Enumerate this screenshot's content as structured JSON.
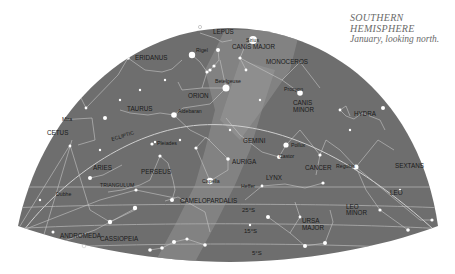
{
  "caption": {
    "line1": "SOUTHERN",
    "line2": "HEMISPHERE",
    "line3": "January, looking north."
  },
  "colors": {
    "sky": "#6e6e6e",
    "milky_way": "#8c8c8c",
    "lines": "#c8c8c8",
    "stars": "#ffffff",
    "labels": "#1a1a1a",
    "caption": "#6a6a6a"
  },
  "constellations": [
    {
      "name": "LEPUS",
      "x": 213,
      "y": 34
    },
    {
      "name": "CANIS MAJOR",
      "x": 232,
      "y": 48
    },
    {
      "name": "ERIDANUS",
      "x": 135,
      "y": 60
    },
    {
      "name": "MONOCEROS",
      "x": 266,
      "y": 64
    },
    {
      "name": "ORION",
      "x": 188,
      "y": 98
    },
    {
      "name": "CANIS MINOR",
      "x": 293,
      "y": 106
    },
    {
      "name": "TAURUS",
      "x": 127,
      "y": 110
    },
    {
      "name": "HYDRA",
      "x": 354,
      "y": 115
    },
    {
      "name": "CETUS",
      "x": 47,
      "y": 135
    },
    {
      "name": "GEMINI",
      "x": 243,
      "y": 143
    },
    {
      "name": "AURIGA",
      "x": 232,
      "y": 163
    },
    {
      "name": "CANCER",
      "x": 305,
      "y": 169
    },
    {
      "name": "SEXTANS",
      "x": 395,
      "y": 167
    },
    {
      "name": "ARIES",
      "x": 93,
      "y": 170
    },
    {
      "name": "PERSEUS",
      "x": 141,
      "y": 173
    },
    {
      "name": "TRIANGULUM",
      "x": 100,
      "y": 187
    },
    {
      "name": "LYNX",
      "x": 266,
      "y": 180
    },
    {
      "name": "LEO",
      "x": 390,
      "y": 194
    },
    {
      "name": "CAMELOPARDALIS",
      "x": 180,
      "y": 202
    },
    {
      "name": "LEO MINOR",
      "x": 346,
      "y": 208
    },
    {
      "name": "URSA MAJOR",
      "x": 302,
      "y": 222
    },
    {
      "name": "PEGASUS",
      "x": 60,
      "y": 237
    },
    {
      "name": "ANDROMEDA",
      "x": 100,
      "y": 240
    },
    {
      "name": "CASSIOPEIA",
      "x": 177,
      "y": 243
    }
  ],
  "stars": [
    {
      "name": "Sirius",
      "x": 253,
      "y": 40
    },
    {
      "name": "Rigel",
      "x": 192,
      "y": 55
    },
    {
      "name": "Betelgeuse",
      "x": 226,
      "y": 88
    },
    {
      "name": "Procyon",
      "x": 300,
      "y": 93
    },
    {
      "name": "Mira",
      "x": 62,
      "y": 120
    },
    {
      "name": "Aldebaran",
      "x": 174,
      "y": 115
    },
    {
      "name": "Pollux",
      "x": 286,
      "y": 145
    },
    {
      "name": "Castor",
      "x": 279,
      "y": 157
    },
    {
      "name": "Pleiades",
      "x": 152,
      "y": 144
    },
    {
      "name": "Regulus",
      "x": 356,
      "y": 167
    },
    {
      "name": "Capella",
      "x": 210,
      "y": 181
    },
    {
      "name": "Dubhe",
      "x": 63,
      "y": 194
    }
  ],
  "annotations": [
    {
      "text": "ECLIPTIC",
      "x": 112,
      "y": 141,
      "rotate": -17
    },
    {
      "text": "25°S",
      "x": 242,
      "y": 212
    },
    {
      "text": "15°S",
      "x": 244,
      "y": 233
    },
    {
      "text": "5°S",
      "x": 252,
      "y": 255
    },
    {
      "text": "Heffer",
      "x": 241,
      "y": 187
    }
  ]
}
